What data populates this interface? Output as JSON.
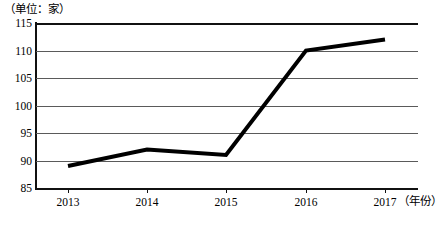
{
  "chart_data": {
    "type": "line",
    "title": "",
    "subtitle": "",
    "unit_label": "（单位：家）",
    "xlabel": "（年份）",
    "ylabel": "",
    "categories": [
      "2013",
      "2014",
      "2015",
      "2016",
      "2017"
    ],
    "x": [
      2013,
      2014,
      2015,
      2016,
      2017
    ],
    "series": [
      {
        "name": "数量",
        "values": [
          89,
          92,
          91,
          110,
          112
        ]
      }
    ],
    "values": [
      89,
      92,
      91,
      110,
      112
    ],
    "ylim": [
      85,
      115
    ],
    "ytick_step": 5,
    "yticks": [
      "115",
      "110",
      "105",
      "100",
      "95",
      "90",
      "85"
    ],
    "ytick_values": [
      115,
      110,
      105,
      100,
      95,
      90,
      85
    ],
    "xticks": [
      "2013",
      "2014",
      "2015",
      "2016",
      "2017"
    ],
    "grid": true,
    "grid_axis": "y",
    "legend": false,
    "legend_position": "none",
    "line_color": "#000000",
    "line_width": 4,
    "grid_color": "#5a5a5a",
    "axis_color": "#111111",
    "background_color": "#ffffff",
    "markers": false,
    "annotations": []
  }
}
